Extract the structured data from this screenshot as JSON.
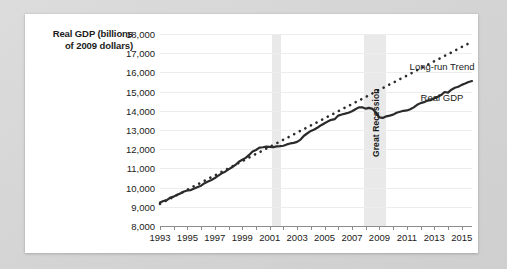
{
  "figure": {
    "card_background": "#ffffff",
    "page_background": "#d8d8d8"
  },
  "chart_data": {
    "type": "line",
    "title": "",
    "ylabel": "Real GDP (billions of 2009 dollars)",
    "ylabel_line1": "Real GDP (billions",
    "ylabel_line2": "of 2009 dollars)",
    "xlabel": "",
    "ylim": [
      8000,
      18000
    ],
    "ytick_step": 1000,
    "yticks": [
      8000,
      9000,
      10000,
      11000,
      12000,
      13000,
      14000,
      15000,
      16000,
      17000,
      18000
    ],
    "ytick_labels": [
      "8,000",
      "9,000",
      "10,000",
      "11,000",
      "12,000",
      "13,000",
      "14,000",
      "15,000",
      "16,000",
      "17,000",
      "18,000"
    ],
    "xlim": [
      1993,
      2015.75
    ],
    "xtick_step": 1,
    "xlabel_step": 2,
    "xtick_labels": [
      "1993",
      "1995",
      "1997",
      "1999",
      "2001",
      "2003",
      "2005",
      "2007",
      "2009",
      "2011",
      "2013",
      "2015"
    ],
    "xticks_all": [
      1993,
      1994,
      1995,
      1996,
      1997,
      1998,
      1999,
      2000,
      2001,
      2002,
      2003,
      2004,
      2005,
      2006,
      2007,
      2008,
      2009,
      2010,
      2011,
      2012,
      2013,
      2014,
      2015
    ],
    "grid": "horizontal",
    "legend_position": "inline-annotations",
    "series": [
      {
        "name": "Real GDP",
        "style": "solid",
        "color": "#2b2b2b",
        "x": [
          1993.0,
          1993.25,
          1993.5,
          1993.75,
          1994.0,
          1994.25,
          1994.5,
          1994.75,
          1995.0,
          1995.25,
          1995.5,
          1995.75,
          1996.0,
          1996.25,
          1996.5,
          1996.75,
          1997.0,
          1997.25,
          1997.5,
          1997.75,
          1998.0,
          1998.25,
          1998.5,
          1998.75,
          1999.0,
          1999.25,
          1999.5,
          1999.75,
          2000.0,
          2000.25,
          2000.5,
          2000.75,
          2001.0,
          2001.25,
          2001.5,
          2001.75,
          2002.0,
          2002.25,
          2002.5,
          2002.75,
          2003.0,
          2003.25,
          2003.5,
          2003.75,
          2004.0,
          2004.25,
          2004.5,
          2004.75,
          2005.0,
          2005.25,
          2005.5,
          2005.75,
          2006.0,
          2006.25,
          2006.5,
          2006.75,
          2007.0,
          2007.25,
          2007.5,
          2007.75,
          2008.0,
          2008.25,
          2008.5,
          2008.75,
          2009.0,
          2009.25,
          2009.5,
          2009.75,
          2010.0,
          2010.25,
          2010.5,
          2010.75,
          2011.0,
          2011.25,
          2011.5,
          2011.75,
          2012.0,
          2012.25,
          2012.5,
          2012.75,
          2013.0,
          2013.25,
          2013.5,
          2013.75,
          2014.0,
          2014.25,
          2014.5,
          2014.75,
          2015.0,
          2015.25,
          2015.5,
          2015.75
        ],
        "y": [
          9220,
          9300,
          9350,
          9480,
          9530,
          9630,
          9700,
          9800,
          9850,
          9870,
          9950,
          10030,
          10100,
          10230,
          10320,
          10400,
          10500,
          10620,
          10740,
          10830,
          10950,
          11060,
          11180,
          11350,
          11450,
          11550,
          11700,
          11880,
          11960,
          12080,
          12100,
          12130,
          12120,
          12100,
          12150,
          12160,
          12180,
          12250,
          12300,
          12330,
          12380,
          12500,
          12700,
          12830,
          12950,
          13030,
          13130,
          13250,
          13350,
          13450,
          13530,
          13570,
          13750,
          13810,
          13850,
          13900,
          13980,
          14080,
          14180,
          14180,
          14110,
          14150,
          14100,
          13900,
          13660,
          13630,
          13710,
          13750,
          13800,
          13900,
          13950,
          14000,
          14020,
          14080,
          14180,
          14310,
          14400,
          14450,
          14530,
          14560,
          14650,
          14730,
          14820,
          14980,
          14950,
          15100,
          15200,
          15250,
          15350,
          15420,
          15500,
          15550
        ]
      },
      {
        "name": "Long-run Trend",
        "style": "dotted",
        "color": "#2b2b2b",
        "x": [
          1993.0,
          2015.75
        ],
        "y": [
          9150,
          17600
        ]
      }
    ],
    "annotations": [
      {
        "name": "long-run-trend-label",
        "text": "Long-run Trend",
        "x": 2011.2,
        "y": 16600
      },
      {
        "name": "real-gdp-label",
        "text": "Real GDP",
        "x": 2012.0,
        "y": 15000
      },
      {
        "name": "great-recession-label",
        "text": "Great Recession",
        "x": 2008.35,
        "y": 11600,
        "rotation": -90
      }
    ],
    "shaded_bands": [
      {
        "name": "recession-2001",
        "label": "",
        "x_start": 2001.2,
        "x_end": 2001.85,
        "color": "#e9e9e9"
      },
      {
        "name": "great-recession",
        "label": "Great Recession",
        "x_start": 2007.9,
        "x_end": 2009.45,
        "color": "#e9e9e9"
      }
    ]
  }
}
